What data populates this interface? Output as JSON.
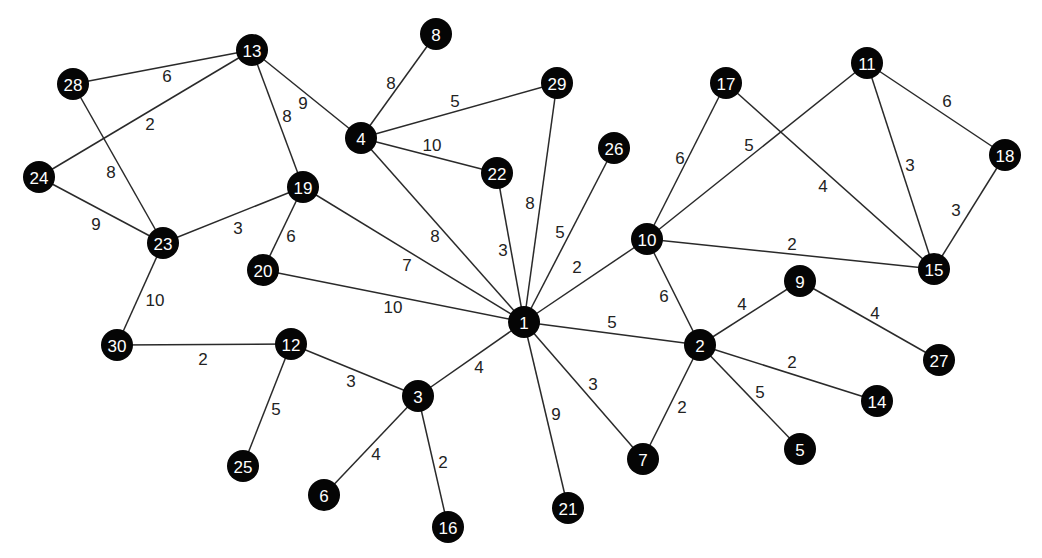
{
  "graph": {
    "type": "weighted-undirected-graph",
    "node_color": "#050505",
    "node_text_color": "#ffffff",
    "edge_color": "#2a2a2a",
    "nodes": [
      {
        "id": "1",
        "x": 524,
        "y": 322
      },
      {
        "id": "2",
        "x": 700,
        "y": 345
      },
      {
        "id": "3",
        "x": 418,
        "y": 396
      },
      {
        "id": "4",
        "x": 361,
        "y": 138
      },
      {
        "id": "5",
        "x": 800,
        "y": 449
      },
      {
        "id": "6",
        "x": 324,
        "y": 495
      },
      {
        "id": "7",
        "x": 643,
        "y": 459
      },
      {
        "id": "8",
        "x": 436,
        "y": 34
      },
      {
        "id": "9",
        "x": 800,
        "y": 281
      },
      {
        "id": "10",
        "x": 647,
        "y": 239
      },
      {
        "id": "11",
        "x": 867,
        "y": 63
      },
      {
        "id": "12",
        "x": 291,
        "y": 344
      },
      {
        "id": "13",
        "x": 252,
        "y": 50
      },
      {
        "id": "14",
        "x": 877,
        "y": 401
      },
      {
        "id": "15",
        "x": 934,
        "y": 269
      },
      {
        "id": "16",
        "x": 448,
        "y": 527
      },
      {
        "id": "17",
        "x": 726,
        "y": 83
      },
      {
        "id": "18",
        "x": 1005,
        "y": 155
      },
      {
        "id": "19",
        "x": 303,
        "y": 187
      },
      {
        "id": "20",
        "x": 263,
        "y": 270
      },
      {
        "id": "21",
        "x": 568,
        "y": 508
      },
      {
        "id": "22",
        "x": 497,
        "y": 173
      },
      {
        "id": "23",
        "x": 163,
        "y": 243
      },
      {
        "id": "24",
        "x": 39,
        "y": 177
      },
      {
        "id": "25",
        "x": 243,
        "y": 466
      },
      {
        "id": "26",
        "x": 614,
        "y": 148
      },
      {
        "id": "27",
        "x": 939,
        "y": 360
      },
      {
        "id": "28",
        "x": 73,
        "y": 84
      },
      {
        "id": "29",
        "x": 557,
        "y": 83
      },
      {
        "id": "30",
        "x": 117,
        "y": 345
      }
    ],
    "edges": [
      {
        "from": "13",
        "to": "28",
        "weight": "6",
        "lx": 167,
        "ly": 76
      },
      {
        "from": "13",
        "to": "24",
        "weight": "2",
        "lx": 150,
        "ly": 124
      },
      {
        "from": "13",
        "to": "4",
        "weight": "9",
        "lx": 303,
        "ly": 103
      },
      {
        "from": "13",
        "to": "19",
        "weight": "8",
        "lx": 287,
        "ly": 116
      },
      {
        "from": "28",
        "to": "23",
        "weight": "8",
        "lx": 111,
        "ly": 172
      },
      {
        "from": "24",
        "to": "23",
        "weight": "9",
        "lx": 96,
        "ly": 224
      },
      {
        "from": "23",
        "to": "19",
        "weight": "3",
        "lx": 238,
        "ly": 228
      },
      {
        "from": "23",
        "to": "30",
        "weight": "10",
        "lx": 155,
        "ly": 300
      },
      {
        "from": "19",
        "to": "20",
        "weight": "6",
        "lx": 291,
        "ly": 236
      },
      {
        "from": "19",
        "to": "1",
        "weight": "7",
        "lx": 407,
        "ly": 265
      },
      {
        "from": "20",
        "to": "1",
        "weight": "10",
        "lx": 393,
        "ly": 307
      },
      {
        "from": "4",
        "to": "8",
        "weight": "8",
        "lx": 391,
        "ly": 83
      },
      {
        "from": "4",
        "to": "29",
        "weight": "5",
        "lx": 455,
        "ly": 101
      },
      {
        "from": "4",
        "to": "22",
        "weight": "10",
        "lx": 432,
        "ly": 145
      },
      {
        "from": "4",
        "to": "1",
        "weight": "8",
        "lx": 435,
        "ly": 236
      },
      {
        "from": "22",
        "to": "1",
        "weight": "3",
        "lx": 503,
        "ly": 250
      },
      {
        "from": "29",
        "to": "1",
        "weight": "8",
        "lx": 530,
        "ly": 203
      },
      {
        "from": "26",
        "to": "1",
        "weight": "5",
        "lx": 560,
        "ly": 232
      },
      {
        "from": "1",
        "to": "10",
        "weight": "2",
        "lx": 577,
        "ly": 267
      },
      {
        "from": "1",
        "to": "2",
        "weight": "5",
        "lx": 612,
        "ly": 322
      },
      {
        "from": "1",
        "to": "3",
        "weight": "4",
        "lx": 479,
        "ly": 367
      },
      {
        "from": "1",
        "to": "7",
        "weight": "3",
        "lx": 593,
        "ly": 384
      },
      {
        "from": "1",
        "to": "21",
        "weight": "9",
        "lx": 556,
        "ly": 414
      },
      {
        "from": "10",
        "to": "17",
        "weight": "6",
        "lx": 680,
        "ly": 158
      },
      {
        "from": "10",
        "to": "11",
        "weight": "5",
        "lx": 749,
        "ly": 145
      },
      {
        "from": "10",
        "to": "15",
        "weight": "2",
        "lx": 792,
        "ly": 244
      },
      {
        "from": "10",
        "to": "2",
        "weight": "6",
        "lx": 664,
        "ly": 296
      },
      {
        "from": "17",
        "to": "15",
        "weight": "4",
        "lx": 823,
        "ly": 186
      },
      {
        "from": "11",
        "to": "18",
        "weight": "6",
        "lx": 947,
        "ly": 101
      },
      {
        "from": "11",
        "to": "15",
        "weight": "3",
        "lx": 910,
        "ly": 165
      },
      {
        "from": "18",
        "to": "15",
        "weight": "3",
        "lx": 956,
        "ly": 210
      },
      {
        "from": "2",
        "to": "9",
        "weight": "4",
        "lx": 742,
        "ly": 304
      },
      {
        "from": "9",
        "to": "27",
        "weight": "4",
        "lx": 875,
        "ly": 313
      },
      {
        "from": "2",
        "to": "14",
        "weight": "2",
        "lx": 792,
        "ly": 362
      },
      {
        "from": "2",
        "to": "5",
        "weight": "5",
        "lx": 760,
        "ly": 392
      },
      {
        "from": "2",
        "to": "7",
        "weight": "2",
        "lx": 682,
        "ly": 407
      },
      {
        "from": "30",
        "to": "12",
        "weight": "2",
        "lx": 203,
        "ly": 359
      },
      {
        "from": "12",
        "to": "3",
        "weight": "3",
        "lx": 351,
        "ly": 381
      },
      {
        "from": "12",
        "to": "25",
        "weight": "5",
        "lx": 276,
        "ly": 409
      },
      {
        "from": "3",
        "to": "6",
        "weight": "4",
        "lx": 376,
        "ly": 454
      },
      {
        "from": "3",
        "to": "16",
        "weight": "2",
        "lx": 443,
        "ly": 462
      }
    ]
  }
}
